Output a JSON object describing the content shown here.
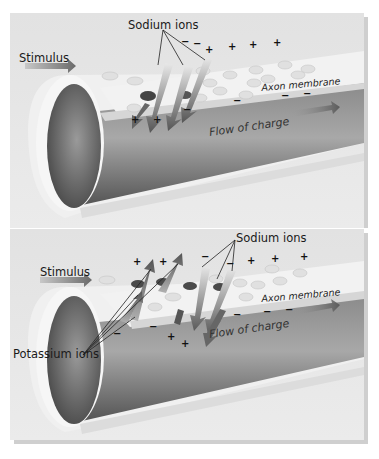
{
  "figure": {
    "colors": {
      "background": "#e6e6e6",
      "tube_inner_dark": "#5c5c5c",
      "tube_inner_light": "#9a9a9a",
      "membrane_surface": "#f2f2f2",
      "membrane_edge": "#d8d8d8",
      "arrow_dark": "#6a6a6a",
      "arrow_light": "#c8c8c8",
      "text": "#1a1a1a"
    }
  },
  "panels": [
    {
      "id": "top",
      "labels": {
        "stimulus": "Stimulus",
        "sodium": "Sodium ions",
        "axon_membrane": "Axon membrane",
        "flow": "Flow of charge"
      },
      "signs": [
        {
          "t": "−",
          "x": 181,
          "y": 37
        },
        {
          "t": "−",
          "x": 193,
          "y": 39
        },
        {
          "t": "+",
          "x": 205,
          "y": 45
        },
        {
          "t": "+",
          "x": 228,
          "y": 42
        },
        {
          "t": "+",
          "x": 249,
          "y": 40
        },
        {
          "t": "+",
          "x": 273,
          "y": 38
        },
        {
          "t": "+",
          "x": 131,
          "y": 115
        },
        {
          "t": "+",
          "x": 153,
          "y": 115
        },
        {
          "t": "−",
          "x": 183,
          "y": 105
        },
        {
          "t": "−",
          "x": 233,
          "y": 96
        },
        {
          "t": "−",
          "x": 281,
          "y": 91
        },
        {
          "t": "−",
          "x": 303,
          "y": 89
        }
      ]
    },
    {
      "id": "bottom",
      "labels": {
        "stimulus": "Stimulus",
        "sodium": "Sodium ions",
        "potassium": "Potassium ions",
        "axon_membrane": "Axon membrane",
        "flow": "Flow of charge"
      },
      "signs": [
        {
          "t": "+",
          "x": 133,
          "y": 257
        },
        {
          "t": "+",
          "x": 159,
          "y": 257
        },
        {
          "t": "−",
          "x": 201,
          "y": 252
        },
        {
          "t": "−",
          "x": 226,
          "y": 259
        },
        {
          "t": "+",
          "x": 247,
          "y": 256
        },
        {
          "t": "+",
          "x": 271,
          "y": 254
        },
        {
          "t": "+",
          "x": 300,
          "y": 252
        },
        {
          "t": "−",
          "x": 113,
          "y": 329
        },
        {
          "t": "−",
          "x": 149,
          "y": 322
        },
        {
          "t": "+",
          "x": 167,
          "y": 332
        },
        {
          "t": "+",
          "x": 181,
          "y": 339
        },
        {
          "t": "−",
          "x": 233,
          "y": 310
        },
        {
          "t": "−",
          "x": 263,
          "y": 307
        },
        {
          "t": "−",
          "x": 285,
          "y": 305
        }
      ]
    }
  ]
}
